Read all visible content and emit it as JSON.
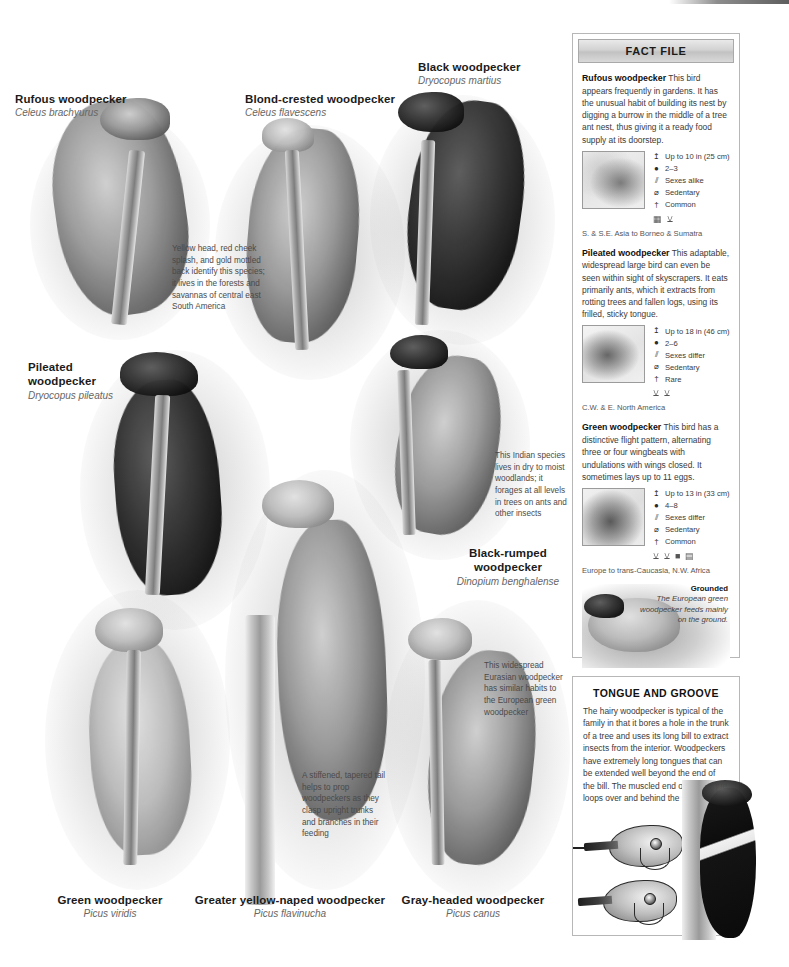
{
  "species": [
    {
      "id": "rufous",
      "common": "Rufous woodpecker",
      "sci": "Celeus brachyurus"
    },
    {
      "id": "blond",
      "common": "Blond-crested woodpecker",
      "sci": "Celeus flavescens"
    },
    {
      "id": "black",
      "common": "Black woodpecker",
      "sci": "Dryocopus martius"
    },
    {
      "id": "pileated",
      "common": "Pileated\nwoodpecker",
      "sci": "Dryocopus pileatus"
    },
    {
      "id": "blackrumped",
      "common": "Black-rumped\nwoodpecker",
      "sci": "Dinopium benghalense"
    },
    {
      "id": "green",
      "common": "Green woodpecker",
      "sci": "Picus viridis"
    },
    {
      "id": "greateryellow",
      "common": "Greater yellow-naped woodpecker",
      "sci": "Picus flavinucha"
    },
    {
      "id": "grayheaded",
      "common": "Gray-headed woodpecker",
      "sci": "Picus canus"
    }
  ],
  "annotations": [
    {
      "id": "blond-note",
      "text": "Yellow head, red cheek splash, and gold mottled back identify this species; it lives in the forests and savannas of central east South America"
    },
    {
      "id": "blackrumped-note",
      "text": "This Indian species lives in dry to moist woodlands; it forages at all levels in trees on ants and other insects"
    },
    {
      "id": "grayheaded-note",
      "text": "This widespread Eurasian woodpecker has similar habits to the European green woodpecker"
    },
    {
      "id": "tail-note",
      "text": "A stiffened, tapered tail helps to prop woodpeckers as they clasp upright trunks and branches in their feeding"
    }
  ],
  "fact_file": {
    "header": "FACT FILE",
    "entries": [
      {
        "name": "Rufous woodpecker",
        "text": "This bird appears frequently in gardens. It has the unusual habit of building its nest by digging a burrow in the middle of a tree ant nest, thus giving it a ready food supply at its doorstep.",
        "map_class": "asia",
        "stats": [
          {
            "icon": "size-icon",
            "glyph": "↥",
            "value": "Up to 10 in (25 cm)"
          },
          {
            "icon": "eggs-icon",
            "glyph": "●",
            "value": "2–3"
          },
          {
            "icon": "sexes-icon",
            "glyph": "⫽",
            "value": "Sexes alike"
          },
          {
            "icon": "migration-icon",
            "glyph": "⌀",
            "value": "Sedentary"
          },
          {
            "icon": "status-icon",
            "glyph": "†",
            "value": "Common"
          }
        ],
        "habitat_icons": [
          "urban-icon",
          "tree-icon"
        ],
        "range": "S. & S.E. Asia to Borneo & Sumatra"
      },
      {
        "name": "Pileated woodpecker",
        "text": "This adaptable, widespread large bird can even be seen within sight of skyscrapers. It eats primarily ants, which it extracts from rotting trees and fallen logs, using its frilled, sticky tongue.",
        "map_class": "na",
        "stats": [
          {
            "icon": "size-icon",
            "glyph": "↥",
            "value": "Up to 18 in (46 cm)"
          },
          {
            "icon": "eggs-icon",
            "glyph": "●",
            "value": "2–6"
          },
          {
            "icon": "sexes-icon",
            "glyph": "⫽",
            "value": "Sexes differ"
          },
          {
            "icon": "migration-icon",
            "glyph": "⌀",
            "value": "Sedentary"
          },
          {
            "icon": "status-icon",
            "glyph": "†",
            "value": "Rare"
          }
        ],
        "habitat_icons": [
          "tree-icon",
          "tree-icon"
        ],
        "range": "C.W. & E. North America"
      },
      {
        "name": "Green woodpecker",
        "text": "This bird has a distinctive flight pattern, alternating three or four wingbeats with undulations with wings closed. It sometimes lays up to 11 eggs.",
        "map_class": "eu",
        "stats": [
          {
            "icon": "size-icon",
            "glyph": "↥",
            "value": "Up to 13 in (33 cm)"
          },
          {
            "icon": "eggs-icon",
            "glyph": "●",
            "value": "4–8"
          },
          {
            "icon": "sexes-icon",
            "glyph": "⫽",
            "value": "Sexes differ"
          },
          {
            "icon": "migration-icon",
            "glyph": "⌀",
            "value": "Sedentary"
          },
          {
            "icon": "status-icon",
            "glyph": "†",
            "value": "Common"
          }
        ],
        "habitat_icons": [
          "tree-icon",
          "tree-icon",
          "grass-icon",
          "ground-icon"
        ],
        "range": "Europe to trans-Caucasia, N.W. Africa"
      }
    ],
    "photo": {
      "caption_title": "Grounded",
      "caption_text": "The European green woodpecker feeds mainly on the ground."
    }
  },
  "tongue_panel": {
    "title": "TONGUE AND GROOVE",
    "text": "The hairy woodpecker is typical of the family in that it bores a hole in the trunk of a tree and uses its long bill to extract insects from the interior. Woodpeckers have extremely long tongues that can be extended well beyond the end of the bill. The muscled end of the tongue loops over and behind the skull."
  },
  "colors": {
    "ink": "#231f20",
    "muted": "#4a4a4a",
    "panel_border": "#b7b7b7",
    "header_grey": "#d2d2d2"
  }
}
